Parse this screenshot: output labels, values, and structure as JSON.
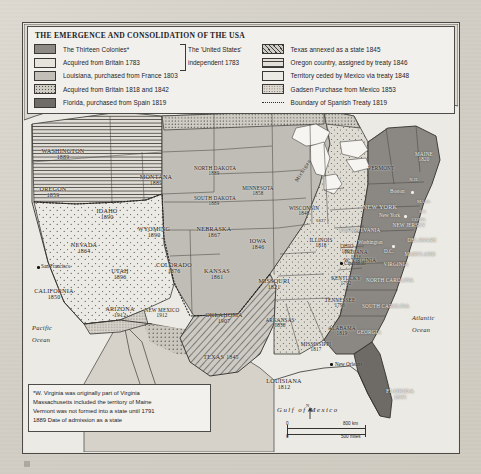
{
  "legend": {
    "title": "THE EMERGENCE AND CONSOLIDATION OF THE USA",
    "left_items": [
      {
        "label": "The Thirteen Colonies*",
        "swatch": "thirteen-colonies-swatch"
      },
      {
        "label": "Acquired from Britain 1783",
        "swatch": "britain-1783-swatch"
      },
      {
        "label": "Louisiana, purchased from France 1803",
        "swatch": "louisiana-purchase-swatch"
      },
      {
        "label": "Acquired from Britain 1818 and 1842",
        "swatch": "britain-1818-1842-swatch"
      },
      {
        "label": "Florida, purchased from Spain 1819",
        "swatch": "florida-1819-swatch"
      }
    ],
    "brace_label_line1": "The 'United States'",
    "brace_label_line2": "independent 1783",
    "right_items": [
      {
        "label": "Texas annexed as a state 1845",
        "swatch": "texas-1845-swatch"
      },
      {
        "label": "Oregon country, assigned by treaty 1846",
        "swatch": "oregon-1846-swatch"
      },
      {
        "label": "Territory ceded by Mexico via treaty 1848",
        "swatch": "mexico-cession-1848-swatch"
      },
      {
        "label": "Gadsen Purchase from Mexico 1853",
        "swatch": "gadsden-1853-swatch"
      },
      {
        "label": "Boundary of Spanish Treaty 1819",
        "swatch": "spanish-treaty-line-swatch"
      }
    ]
  },
  "note": {
    "line1": "*W. Virginia was originally part of Virginia",
    "line2": "Massachusetts included the territory of Maine",
    "line3": "Vermont was not formed into a state until 1791",
    "line4": "1889 Date of admission as a state"
  },
  "scale": {
    "km": "800 km",
    "miles": "500 miles",
    "zero_top": "0",
    "zero_bottom": "0"
  },
  "compass": {
    "north": "N"
  },
  "oceans": {
    "pacific_line1": "Pacific",
    "pacific_line2": "Ocean",
    "atlantic_line1": "Atlantic",
    "atlantic_line2": "Ocean",
    "gulf": "Gulf of Mexico",
    "lake_michigan": "Michigan"
  },
  "cities": [
    {
      "name": "San Francisco"
    },
    {
      "name": "Boston"
    },
    {
      "name": "New York"
    },
    {
      "name": "Washington"
    },
    {
      "name": "D.C."
    },
    {
      "name": "Cincinnati"
    },
    {
      "name": "New Orleans"
    }
  ],
  "states": [
    {
      "name": "WASHINGTON",
      "year": "1889"
    },
    {
      "name": "OREGON",
      "year": "1859"
    },
    {
      "name": "IDAHO",
      "year": "1890"
    },
    {
      "name": "MONTANA",
      "year": "1889"
    },
    {
      "name": "WYOMING",
      "year": "1890"
    },
    {
      "name": "NEVADA",
      "year": "1864"
    },
    {
      "name": "UTAH",
      "year": "1896"
    },
    {
      "name": "CALIFORNIA",
      "year": "1850"
    },
    {
      "name": "ARIZONA",
      "year": "1912"
    },
    {
      "name": "NEW MEXICO",
      "year": "1912"
    },
    {
      "name": "COLORADO",
      "year": "1876"
    },
    {
      "name": "NORTH DAKOTA",
      "year": "1889"
    },
    {
      "name": "SOUTH DAKOTA",
      "year": "1889"
    },
    {
      "name": "NEBRASKA",
      "year": "1867"
    },
    {
      "name": "KANSAS",
      "year": "1861"
    },
    {
      "name": "OKLAHOMA",
      "year": "1907"
    },
    {
      "name": "TEXAS",
      "year": "1845"
    },
    {
      "name": "MINNESOTA",
      "year": "1858"
    },
    {
      "name": "IOWA",
      "year": "1846"
    },
    {
      "name": "MISSOURI",
      "year": "1821"
    },
    {
      "name": "ARKANSAS",
      "year": "1836"
    },
    {
      "name": "LOUISIANA",
      "year": "1812"
    },
    {
      "name": "WISCONSIN",
      "year": "1848"
    },
    {
      "name": "ILLINOIS",
      "year": "1818"
    },
    {
      "name": "MICHIGAN",
      "year": "1837"
    },
    {
      "name": "INDIANA",
      "year": "1816"
    },
    {
      "name": "OHIO",
      "year": "1803"
    },
    {
      "name": "KENTUCKY",
      "year": "1792"
    },
    {
      "name": "TENNESSEE",
      "year": "1796"
    },
    {
      "name": "MISSISSIPPI",
      "year": "1817"
    },
    {
      "name": "ALABAMA",
      "year": "1819"
    },
    {
      "name": "FLORIDA",
      "year": "1845"
    },
    {
      "name": "GEORGIA",
      "year": ""
    },
    {
      "name": "SOUTH CAROLINA",
      "year": ""
    },
    {
      "name": "NORTH CAROLINA",
      "year": ""
    },
    {
      "name": "VIRGINIA",
      "year": ""
    },
    {
      "name": "W. VIRGINIA",
      "year": ""
    },
    {
      "name": "MARYLAND",
      "year": ""
    },
    {
      "name": "DELAWARE",
      "year": ""
    },
    {
      "name": "PENNSYLVANIA",
      "year": ""
    },
    {
      "name": "NEW JERSEY",
      "year": ""
    },
    {
      "name": "NEW YORK",
      "year": ""
    },
    {
      "name": "CONN.",
      "year": ""
    },
    {
      "name": "R.I.",
      "year": ""
    },
    {
      "name": "MASS.",
      "year": ""
    },
    {
      "name": "N.H.",
      "year": ""
    },
    {
      "name": "VERMONT",
      "year": ""
    },
    {
      "name": "MAINE",
      "year": "1820"
    }
  ],
  "caption": {
    "text": ""
  }
}
